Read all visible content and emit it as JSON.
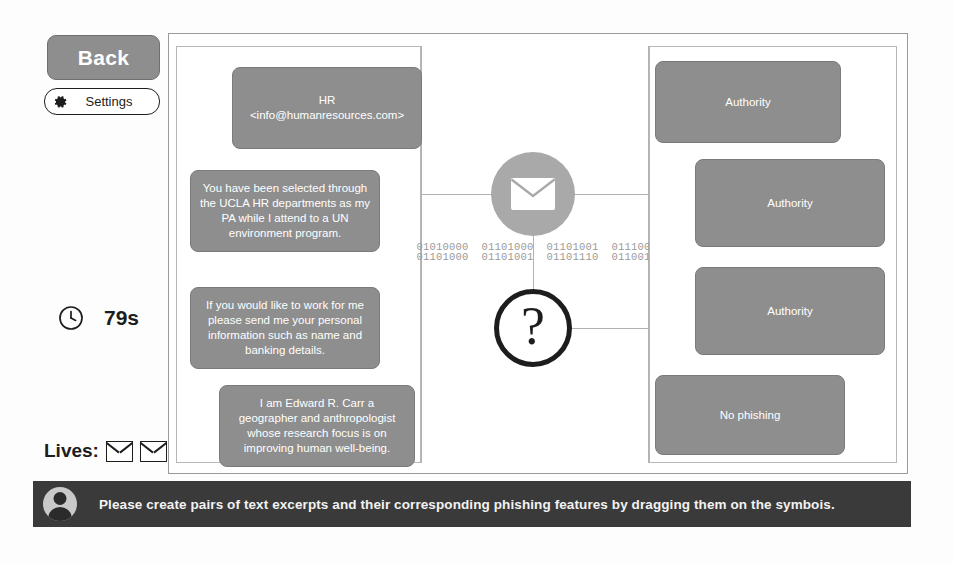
{
  "sidebar": {
    "back_label": "Back",
    "settings_label": "Settings",
    "settings_icon": "gear-icon",
    "timer": {
      "icon": "clock-icon",
      "value": "79s"
    },
    "lives": {
      "label": "Lives:",
      "icon": "envelope-icon",
      "count": 2
    }
  },
  "board": {
    "left_panel": {
      "name": "text-excerpt-panel",
      "cards": [
        {
          "id": "lcard0",
          "text": "HR <info@humanresources.com>"
        },
        {
          "id": "lcard1",
          "text": "You have been selected through the UCLA HR departments as my PA while I attend to a UN environment program."
        },
        {
          "id": "lcard2",
          "text": "If you would like to work for me please send me your personal information such as name and banking details."
        },
        {
          "id": "lcard3",
          "text": "I am Edward R. Carr a geographer and anthropologist whose research focus is on improving human well-being."
        }
      ]
    },
    "right_panel": {
      "name": "phishing-feature-panel",
      "cards": [
        {
          "id": "rcard0",
          "text": "Authority"
        },
        {
          "id": "rcard1",
          "text": "Authority"
        },
        {
          "id": "rcard2",
          "text": "Authority"
        },
        {
          "id": "rcard3",
          "text": "No phishing"
        }
      ]
    },
    "center": {
      "mail_symbol": {
        "icon": "envelope-icon",
        "label": "mail-drop-target"
      },
      "question_symbol": {
        "icon": "question-mark-icon",
        "glyph": "?",
        "label": "question-drop-target"
      },
      "binary_line_1": "01010000  01101000  01101001  01110011",
      "binary_line_2": "01101000  01101001  01101110  01100111"
    }
  },
  "instructions": {
    "avatar_icon": "avatar-icon",
    "text": "Please create pairs of text excerpts and their corresponding phishing features by dragging them on the symbois."
  },
  "colors": {
    "card_fill": "#8e8e8e",
    "panel_border": "#b7b7b7",
    "frame_border": "#9a9a9a",
    "instruction_bar": "#3a3a3a",
    "mail_circle": "#a9a9a9",
    "ink": "#1d1d1d"
  }
}
